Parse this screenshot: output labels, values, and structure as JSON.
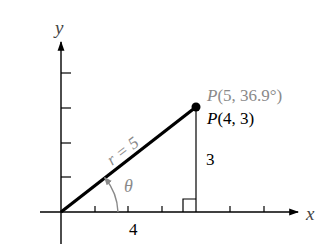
{
  "diagram": {
    "axes": {
      "x_label": "x",
      "y_label": "y"
    },
    "point": {
      "polar_label": "P(5, 36.9°)",
      "rect_label": "P(4, 3)",
      "x": 4,
      "y": 3,
      "r": 5,
      "theta_deg": 36.9
    },
    "radius_label": "r = 5",
    "angle_label": "θ",
    "horizontal_leg_label": "4",
    "vertical_leg_label": "3",
    "colors": {
      "primary": "#000000",
      "secondary": "#8a8a8a"
    }
  }
}
